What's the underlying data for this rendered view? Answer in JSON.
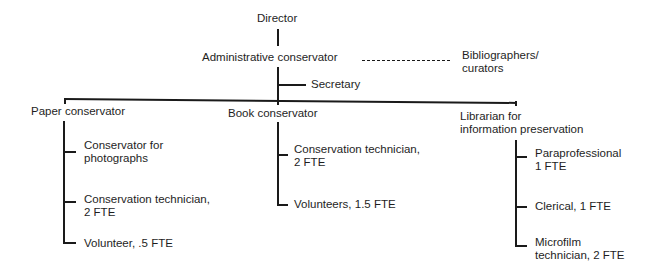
{
  "org_chart": {
    "director": "Director",
    "admin": "Administrative conservator",
    "advisory": {
      "line1": "Bibliographers/",
      "line2": "curators"
    },
    "secretary": "Secretary",
    "departments": [
      {
        "title": "Paper conservator",
        "staff": [
          {
            "line1": "Conservator for",
            "line2": "photographs"
          },
          {
            "line1": "Conservation technician,",
            "line2": "2 FTE"
          },
          {
            "line1": "Volunteer, .5 FTE",
            "line2": ""
          }
        ]
      },
      {
        "title": "Book conservator",
        "staff": [
          {
            "line1": "Conservation technician,",
            "line2": "2 FTE"
          },
          {
            "line1": "Volunteers, 1.5 FTE",
            "line2": ""
          }
        ]
      },
      {
        "title_line1": "Librarian for",
        "title_line2": "information preservation",
        "staff": [
          {
            "line1": "Paraprofessional",
            "line2": "1 FTE"
          },
          {
            "line1": "Clerical, 1 FTE",
            "line2": ""
          },
          {
            "line1": "Microfilm",
            "line2": "technician, 2 FTE"
          }
        ]
      }
    ]
  }
}
